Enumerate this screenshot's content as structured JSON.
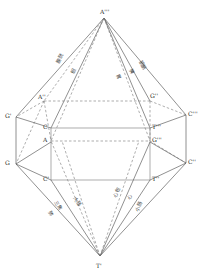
{
  "figure": {
    "title": "",
    "type": "geometric-bipyramid-diagram",
    "stroke_color": "#555555",
    "dash_color": "#777777",
    "prism_color": "#808080",
    "background": "#ffffff"
  },
  "vertices": [
    {
      "id": "apex-top",
      "label": "A'''",
      "x": 104,
      "y": 16
    },
    {
      "id": "apex-bottom",
      "label": "T'",
      "x": 100,
      "y": 258
    },
    {
      "id": "left-upper-outer",
      "label": "G'",
      "x": 14,
      "y": 116
    },
    {
      "id": "left-lower-outer",
      "label": "G",
      "x": 14,
      "y": 163
    },
    {
      "id": "right-upper-outer",
      "label": "C'''",
      "x": 188,
      "y": 114
    },
    {
      "id": "right-lower-outer",
      "label": "C''",
      "x": 188,
      "y": 162
    },
    {
      "id": "inner-top-left",
      "label": "A''",
      "x": 42,
      "y": 100
    },
    {
      "id": "inner-top-right",
      "label": "G''",
      "x": 152,
      "y": 99
    },
    {
      "id": "box-top-left",
      "label": "C",
      "x": 49,
      "y": 127
    },
    {
      "id": "box-top-right",
      "label": "T'''",
      "x": 152,
      "y": 127
    },
    {
      "id": "box-mid-left",
      "label": "A",
      "x": 49,
      "y": 140
    },
    {
      "id": "box-mid-right",
      "label": "G'''",
      "x": 152,
      "y": 140
    },
    {
      "id": "box-bot-left",
      "label": "C'",
      "x": 49,
      "y": 177
    },
    {
      "id": "box-bot-right",
      "label": "T''",
      "x": 152,
      "y": 177
    }
  ],
  "organ_labels": {
    "upper_left": [
      {
        "id": "bladder",
        "text": "膀胱",
        "x": 55,
        "y": 62,
        "rotate": -62
      },
      {
        "id": "gallbladder",
        "text": "胆",
        "x": 70,
        "y": 73,
        "rotate": -68
      }
    ],
    "upper_right": [
      {
        "id": "stomach",
        "text": "胃",
        "x": 120,
        "y": 73,
        "rotate": 66
      },
      {
        "id": "spleen",
        "text": "脾",
        "x": 133,
        "y": 68,
        "rotate": 62
      },
      {
        "id": "liver",
        "text": "膀胱",
        "x": 142,
        "y": 60,
        "rotate": 58
      }
    ],
    "lower_left": [
      {
        "id": "large-intestine",
        "text": "大肠",
        "x": 77,
        "y": 196,
        "rotate": 62
      },
      {
        "id": "triple-burner",
        "text": "三焦",
        "x": 58,
        "y": 200,
        "rotate": 62
      },
      {
        "id": "lung",
        "text": "肺",
        "x": 52,
        "y": 210,
        "rotate": 62
      }
    ],
    "lower_right": [
      {
        "id": "pericardium",
        "text": "心包",
        "x": 112,
        "y": 196,
        "rotate": -62
      },
      {
        "id": "heart",
        "text": "心",
        "x": 126,
        "y": 198,
        "rotate": -62
      },
      {
        "id": "small-intestine",
        "text": "小肠",
        "x": 134,
        "y": 210,
        "rotate": -62
      }
    ]
  }
}
